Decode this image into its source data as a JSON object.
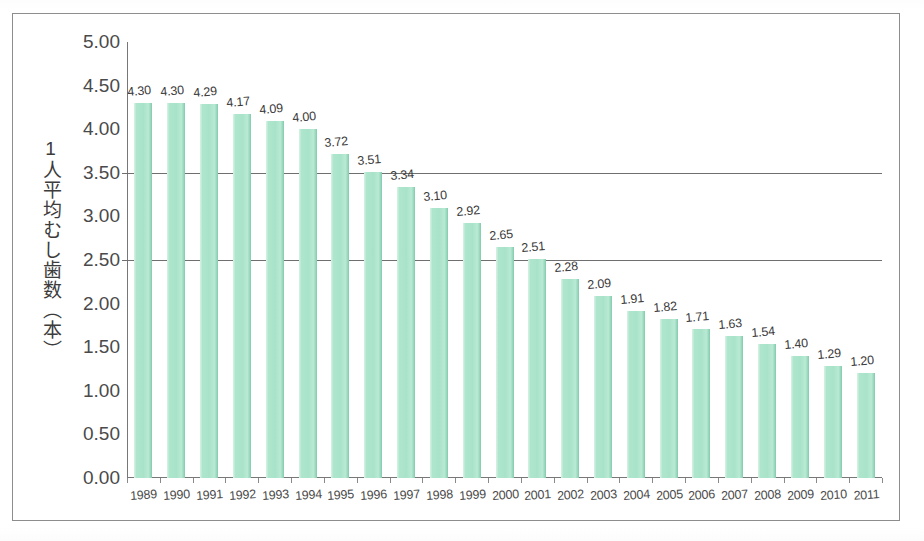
{
  "chart_data": {
    "type": "bar",
    "title": "",
    "subtitle": "",
    "xlabel": "",
    "ylabel": "1人平均むし歯数（本）",
    "ylim": [
      0,
      5
    ],
    "ytick_step": 0.5,
    "grid": true,
    "gridlines_visible": [
      3.5,
      2.5
    ],
    "legend": "none",
    "bar_color": "#aee6cd",
    "categories": [
      "1989",
      "1990",
      "1991",
      "1992",
      "1993",
      "1994",
      "1995",
      "1996",
      "1997",
      "1998",
      "1999",
      "2000",
      "2001",
      "2002",
      "2003",
      "2004",
      "2005",
      "2006",
      "2007",
      "2008",
      "2009",
      "2010",
      "2011"
    ],
    "values": [
      4.3,
      4.3,
      4.29,
      4.17,
      4.09,
      4.0,
      3.72,
      3.51,
      3.34,
      3.1,
      2.92,
      2.65,
      2.51,
      2.28,
      2.09,
      1.91,
      1.82,
      1.71,
      1.63,
      1.54,
      1.4,
      1.29,
      1.2
    ],
    "data_labels": [
      "4.30",
      "4.30",
      "4.29",
      "4.17",
      "4.09",
      "4.00",
      "3.72",
      "3.51",
      "3.34",
      "3.10",
      "2.92",
      "2.65",
      "2.51",
      "2.28",
      "2.09",
      "1.91",
      "1.82",
      "1.71",
      "1.63",
      "1.54",
      "1.40",
      "1.29",
      "1.20"
    ],
    "ytick_labels": [
      "5.00",
      "4.50",
      "4.00",
      "3.50",
      "3.00",
      "2.50",
      "2.00",
      "1.50",
      "1.00",
      "0.50",
      "0.00"
    ],
    "ytick_values": [
      5.0,
      4.5,
      4.0,
      3.5,
      3.0,
      2.5,
      2.0,
      1.5,
      1.0,
      0.5,
      0.0
    ]
  },
  "colors": {
    "bar_fill": "#aee6cd",
    "bar_edge": "#7cc6a6",
    "axis": "#777777",
    "gridline": "#6f6f6f",
    "text": "#3c3c3c",
    "frame": "#8d8d8d",
    "background": "#ffffff"
  }
}
